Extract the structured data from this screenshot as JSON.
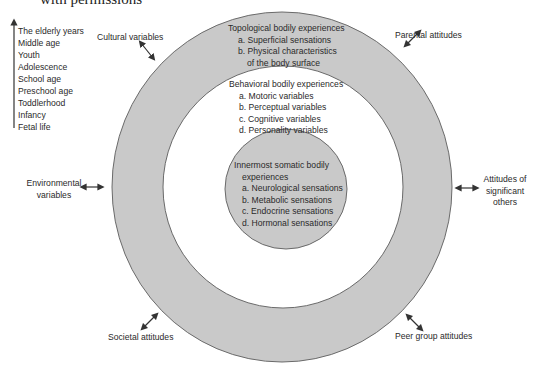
{
  "caption": "with permissions",
  "lifespan": {
    "arrow_direction": "up",
    "stages": [
      "The elderly years",
      "Middle age",
      "Youth",
      "Adolescence",
      "School age",
      "Preschool age",
      "Toddlerhood",
      "Infancy",
      "Fetal life"
    ]
  },
  "rings": {
    "outer": {
      "title": "Topological bodily experiences",
      "items": [
        "a. Superficial sensations",
        "b. Physical characteristics",
        "of the body surface"
      ],
      "fill": "#c9c9c9"
    },
    "middle": {
      "title": "Behavioral bodily experiences",
      "items": [
        "a. Motoric variables",
        "b. Perceptual variables",
        "c. Cognitive variables",
        "d. Personality variables"
      ],
      "fill": "#ffffff"
    },
    "inner": {
      "title_line1": "Innermost somatic bodily",
      "title_line2": "experiences",
      "items": [
        "a. Neurological sensations",
        "b. Metabolic sensations",
        "c. Endocrine sensations",
        "d. Hormonal sensations"
      ],
      "fill": "#c9c9c9"
    }
  },
  "influences": {
    "cultural": "Cultural variables",
    "parental": "Parental attitudes",
    "environmental_line1": "Environmental",
    "environmental_line2": "variables",
    "significant_line1": "Attitudes of",
    "significant_line2": "significant",
    "significant_line3": "others",
    "societal": "Societal attitudes",
    "peer": "Peer group attitudes"
  }
}
